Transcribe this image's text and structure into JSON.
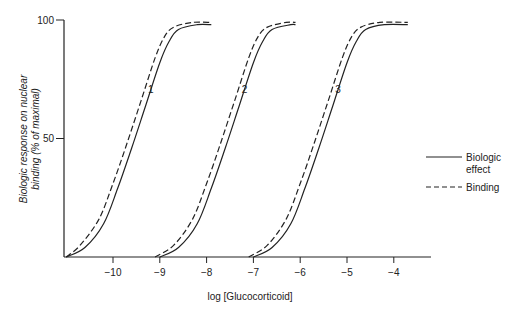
{
  "chart_data": {
    "type": "line",
    "title": "",
    "xlabel": "log [Glucocorticoid]",
    "ylabel": "Biologic response on nuclear binding (% of maximal)",
    "ylabel_lines": [
      "Biologic response on nuclear",
      "binding (% of maximal)"
    ],
    "xlim": [
      -11.05,
      -3.25
    ],
    "ylim": [
      0,
      100
    ],
    "x_ticks": [
      -10,
      -9,
      -8,
      -7,
      -6,
      -5,
      -4
    ],
    "x_tick_labels": [
      "−10",
      "−9",
      "−8",
      "−7",
      "−6",
      "−5",
      "−4"
    ],
    "y_ticks": [
      50,
      100
    ],
    "y_tick_labels": [
      "50",
      "100"
    ],
    "grid": false,
    "legend_position": "right",
    "legend": [
      {
        "label_lines": [
          "Biologic",
          "effect"
        ],
        "style": "solid"
      },
      {
        "label_lines": [
          "Binding"
        ],
        "style": "dashed"
      }
    ],
    "curve_labels": [
      {
        "text": "1",
        "x": -9.25,
        "y": 71
      },
      {
        "text": "2",
        "x": -7.25,
        "y": 71
      },
      {
        "text": "3",
        "x": -5.25,
        "y": 71
      }
    ],
    "series": [
      {
        "name": "Curve 1 - Biologic effect",
        "style": "solid",
        "x": [
          -11.0,
          -10.6,
          -10.2,
          -9.9,
          -9.6,
          -9.3,
          -9.0,
          -8.8,
          -8.6,
          -8.2,
          -7.9
        ],
        "y": [
          0,
          4,
          14,
          29,
          46,
          64,
          82,
          91,
          96,
          98,
          98
        ]
      },
      {
        "name": "Curve 1 - Binding",
        "style": "dashed",
        "x": [
          -11.0,
          -10.7,
          -10.3,
          -10.0,
          -9.7,
          -9.4,
          -9.1,
          -8.9,
          -8.7,
          -8.3,
          -7.9
        ],
        "y": [
          0,
          5,
          16,
          31,
          48,
          66,
          84,
          93,
          97,
          99,
          99
        ]
      },
      {
        "name": "Curve 2 - Biologic effect",
        "style": "solid",
        "x": [
          -9.0,
          -8.6,
          -8.2,
          -7.9,
          -7.6,
          -7.3,
          -7.0,
          -6.8,
          -6.6,
          -6.2,
          -6.1
        ],
        "y": [
          0,
          4,
          14,
          29,
          46,
          64,
          82,
          91,
          96,
          98,
          98
        ]
      },
      {
        "name": "Curve 2 - Binding",
        "style": "dashed",
        "x": [
          -9.1,
          -8.7,
          -8.3,
          -8.0,
          -7.7,
          -7.4,
          -7.1,
          -6.9,
          -6.7,
          -6.3,
          -6.1
        ],
        "y": [
          0,
          5,
          16,
          31,
          48,
          66,
          84,
          93,
          97,
          99,
          99
        ]
      },
      {
        "name": "Curve 3 - Biologic effect",
        "style": "solid",
        "x": [
          -7.0,
          -6.6,
          -6.2,
          -5.9,
          -5.6,
          -5.3,
          -5.0,
          -4.8,
          -4.6,
          -4.2,
          -3.7
        ],
        "y": [
          0,
          4,
          14,
          29,
          46,
          64,
          82,
          91,
          96,
          98,
          98
        ]
      },
      {
        "name": "Curve 3 - Binding",
        "style": "dashed",
        "x": [
          -7.1,
          -6.7,
          -6.3,
          -6.0,
          -5.7,
          -5.4,
          -5.1,
          -4.9,
          -4.7,
          -4.3,
          -3.7
        ],
        "y": [
          0,
          5,
          16,
          31,
          48,
          66,
          84,
          93,
          97,
          99,
          99
        ]
      }
    ]
  },
  "layout": {
    "ink": "#222222",
    "background": "#ffffff"
  }
}
